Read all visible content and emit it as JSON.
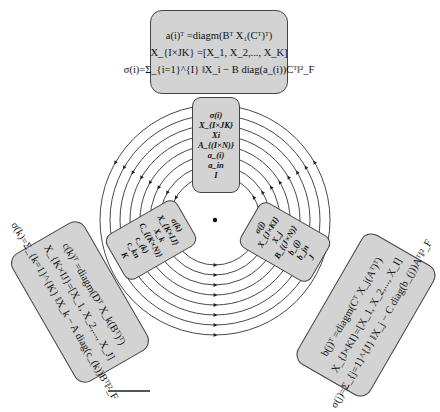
{
  "diagram": {
    "center": {
      "x": 215,
      "y": 220
    },
    "ring_radii": [
      45,
      55,
      65,
      75,
      85,
      95,
      105,
      115
    ],
    "colors": {
      "box_fill": "#d3d3d3",
      "box_border": "#444444",
      "ring": "#333333"
    },
    "outer_boxes": {
      "top": {
        "lines": [
          "a(i)ᵀ =diagm(Bᵀ X₁(Cᵀ)ᵀ)",
          "X_{I×JK} =[X_1, X_2,..., X_K]",
          "σ(i)=Σ_{i=1}^{I} ‖X_i − B diag(a_(i))Cᵀ‖²_F"
        ]
      },
      "bottom_left": {
        "lines": [
          "c(k)ᵀ =diagm(Dᵀ X_k(Bᵀ)ᵀ)",
          "X_{K×IJ}=[X_1, X_2,..., X_J]",
          "σ(k)=Σ_{k=1}^{K} ‖X_k − A diag(c_(k))Bᵀ‖²_F"
        ]
      },
      "bottom_right": {
        "lines": [
          "b(j)ᵀ =diagm(Cᵀ X_j(Aᵀ)ᵀ)",
          "X_{J×KI}=[X_1, X_2,..., X_I]",
          "σ(j)=Σ_{j=1}^{J} ‖X_j − C diag(b_(j))Aᵀ‖²_F"
        ]
      }
    },
    "inner_boxes": {
      "top": {
        "lines": [
          "σ(i)",
          "X_{I×JK}",
          "Xi",
          "A_{(I×N)}",
          "a_(i)",
          "a_in",
          "I"
        ]
      },
      "left": {
        "lines": [
          "σ(k)",
          "X_{K×IJ}",
          "X_k",
          "C_{(K×N)}",
          "c_(k)",
          "c_kn",
          "K"
        ]
      },
      "right": {
        "lines": [
          "σ(j)",
          "X_{J×KI}",
          "X_j",
          "B_{(J×N)}",
          "b_(j)",
          "b_jn",
          "J"
        ]
      }
    }
  }
}
